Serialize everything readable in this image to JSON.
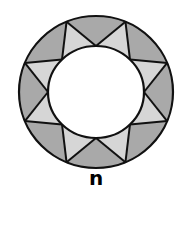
{
  "figure": {
    "label": "n",
    "shape": "ring divided into 16 triangular regions",
    "outer_points": 8,
    "inner_points": 8,
    "colors": {
      "dark_fill": "#a9a9a9",
      "light_fill": "#d6d6d6",
      "stroke": "#111111",
      "center": "#ffffff"
    }
  }
}
